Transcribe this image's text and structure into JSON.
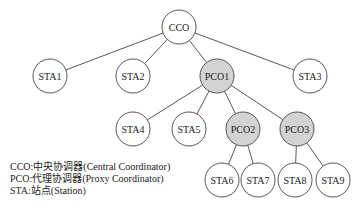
{
  "diagram": {
    "type": "tree",
    "colors": {
      "coordinator_fill": "#d3d3d3",
      "station_fill": "#ffffff",
      "stroke": "#444444"
    },
    "nodes": [
      {
        "id": "CCO",
        "label": "CCO",
        "x": 179,
        "y": 27,
        "r": 17,
        "kind": "central"
      },
      {
        "id": "STA1",
        "label": "STA1",
        "x": 50,
        "y": 76,
        "r": 17,
        "kind": "station"
      },
      {
        "id": "STA2",
        "label": "STA2",
        "x": 133,
        "y": 76,
        "r": 17,
        "kind": "station"
      },
      {
        "id": "PCO1",
        "label": "PCO1",
        "x": 217,
        "y": 76,
        "r": 17,
        "kind": "proxy"
      },
      {
        "id": "STA3",
        "label": "STA3",
        "x": 310,
        "y": 76,
        "r": 17,
        "kind": "station"
      },
      {
        "id": "STA4",
        "label": "STA4",
        "x": 133,
        "y": 129,
        "r": 17,
        "kind": "station"
      },
      {
        "id": "STA5",
        "label": "STA5",
        "x": 189,
        "y": 129,
        "r": 17,
        "kind": "station"
      },
      {
        "id": "PCO2",
        "label": "PCO2",
        "x": 243,
        "y": 129,
        "r": 17,
        "kind": "proxy"
      },
      {
        "id": "PCO3",
        "label": "PCO3",
        "x": 297,
        "y": 129,
        "r": 17,
        "kind": "proxy"
      },
      {
        "id": "STA6",
        "label": "STA6",
        "x": 222,
        "y": 180,
        "r": 17,
        "kind": "station"
      },
      {
        "id": "STA7",
        "label": "STA7",
        "x": 258,
        "y": 180,
        "r": 17,
        "kind": "station"
      },
      {
        "id": "STA8",
        "label": "STA8",
        "x": 295,
        "y": 180,
        "r": 17,
        "kind": "station"
      },
      {
        "id": "STA9",
        "label": "STA9",
        "x": 333,
        "y": 180,
        "r": 17,
        "kind": "station"
      }
    ],
    "edges": [
      [
        "CCO",
        "STA1"
      ],
      [
        "CCO",
        "STA2"
      ],
      [
        "CCO",
        "PCO1"
      ],
      [
        "CCO",
        "STA3"
      ],
      [
        "PCO1",
        "STA4"
      ],
      [
        "PCO1",
        "STA5"
      ],
      [
        "PCO1",
        "PCO2"
      ],
      [
        "PCO1",
        "PCO3"
      ],
      [
        "PCO2",
        "STA6"
      ],
      [
        "PCO2",
        "STA7"
      ],
      [
        "PCO3",
        "STA8"
      ],
      [
        "PCO3",
        "STA9"
      ]
    ]
  },
  "legend": {
    "items": [
      {
        "text": "CCO:中央协调器(Central Coordinator)"
      },
      {
        "text": "PCO:代理协调器(Proxy Coordinator)"
      },
      {
        "text": "STA:站点(Station)"
      }
    ]
  }
}
